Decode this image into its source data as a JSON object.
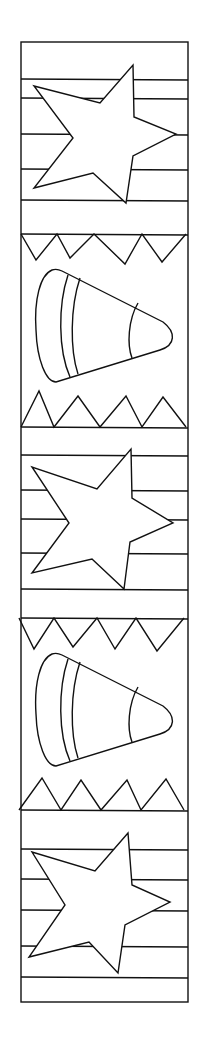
{
  "page": {
    "type": "coloring-page-bookmark",
    "background": "#ffffff",
    "line_color": "#111111"
  },
  "frame": {
    "x": 21,
    "y": 42,
    "width": 167,
    "height": 960
  },
  "sections": [
    {
      "kind": "star-stripes",
      "top": 42,
      "bottom": 234,
      "stripes": [
        79,
        98,
        134,
        169,
        200
      ],
      "star": [
        [
          133,
          65
        ],
        [
          134,
          117
        ],
        [
          176,
          134
        ],
        [
          133,
          156
        ],
        [
          126,
          203
        ],
        [
          93,
          173
        ],
        [
          34,
          188
        ],
        [
          73,
          138
        ],
        [
          34,
          86
        ],
        [
          100,
          103
        ]
      ]
    },
    {
      "kind": "candy-corn",
      "top": 234,
      "bottom": 427,
      "top_zigzag_valleys": [
        [
          36,
          260
        ],
        [
          70,
          258
        ],
        [
          125,
          264
        ],
        [
          162,
          262
        ]
      ],
      "top_zigzag_peaks": [
        21,
        57,
        94,
        142,
        186
      ],
      "bottom_zigzag_peaks": [
        [
          39,
          391
        ],
        [
          78,
          396
        ],
        [
          126,
          396
        ],
        [
          163,
          397
        ]
      ],
      "bottom_zigzag_valleys": [
        21,
        54,
        100,
        142,
        186
      ],
      "corn_offset": 0
    },
    {
      "kind": "star-stripes",
      "top": 427,
      "bottom": 618,
      "stripes": [
        455,
        490,
        519,
        553,
        589
      ],
      "star": [
        [
          131,
          449
        ],
        [
          132,
          498
        ],
        [
          173,
          523
        ],
        [
          130,
          542
        ],
        [
          124,
          589
        ],
        [
          92,
          559
        ],
        [
          32,
          573
        ],
        [
          69,
          523
        ],
        [
          32,
          467
        ],
        [
          97,
          489
        ]
      ]
    },
    {
      "kind": "candy-corn",
      "top": 618,
      "bottom": 810,
      "top_zigzag_valleys": [
        [
          34,
          649
        ],
        [
          73,
          647
        ],
        [
          115,
          649
        ],
        [
          157,
          651
        ]
      ],
      "top_zigzag_peaks": [
        19,
        54,
        97,
        136,
        184
      ],
      "bottom_zigzag_peaks": [
        [
          42,
          778
        ],
        [
          81,
          780
        ],
        [
          127,
          780
        ],
        [
          166,
          779
        ]
      ],
      "bottom_zigzag_valleys": [
        19,
        61,
        101,
        141,
        184
      ],
      "corn_offset": 384
    },
    {
      "kind": "star-stripes",
      "top": 810,
      "bottom": 1002,
      "stripes": [
        849,
        879,
        910,
        946,
        977
      ],
      "star": [
        [
          128,
          833
        ],
        [
          132,
          885
        ],
        [
          170,
          902
        ],
        [
          125,
          925
        ],
        [
          118,
          973
        ],
        [
          89,
          942
        ],
        [
          29,
          957
        ],
        [
          65,
          905
        ],
        [
          32,
          852
        ],
        [
          95,
          871
        ]
      ]
    }
  ]
}
